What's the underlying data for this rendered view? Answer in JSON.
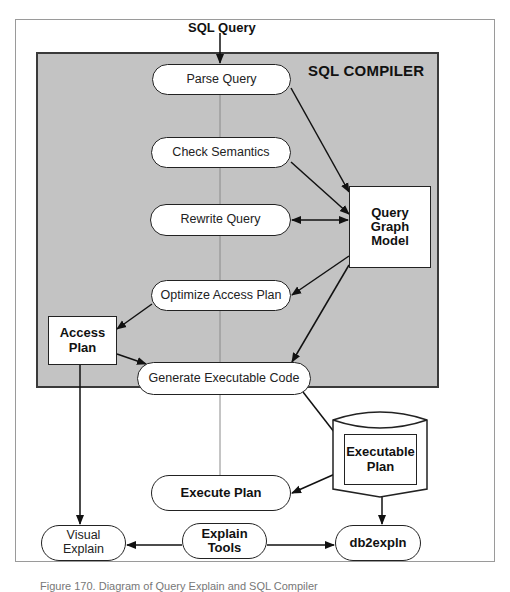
{
  "diagram": {
    "input_label": "SQL Query",
    "compiler_title": "SQL COMPILER",
    "steps": [
      {
        "id": "parse",
        "label": "Parse Query"
      },
      {
        "id": "semantics",
        "label": "Check Semantics"
      },
      {
        "id": "rewrite",
        "label": "Rewrite Query"
      },
      {
        "id": "optimize",
        "label": "Optimize Access Plan"
      },
      {
        "id": "generate",
        "label": "Generate Executable Code"
      }
    ],
    "query_graph_model": {
      "line1": "Query",
      "line2": "Graph",
      "line3": "Model"
    },
    "access_plan": {
      "line1": "Access",
      "line2": "Plan"
    },
    "executable_plan": {
      "line1": "Executable",
      "line2": "Plan"
    },
    "execute_plan": "Execute Plan",
    "visual_explain": {
      "line1": "Visual",
      "line2": "Explain"
    },
    "explain_tools": {
      "line1": "Explain",
      "line2": "Tools"
    },
    "db2expln": "db2expln",
    "colors": {
      "compiler_fill": "#c3c3c3",
      "stroke": "#222222",
      "frame": "#9a9a9a",
      "center_line": "#8a8a8a"
    }
  },
  "caption": "Figure 170. Diagram of Query Explain and SQL Compiler"
}
